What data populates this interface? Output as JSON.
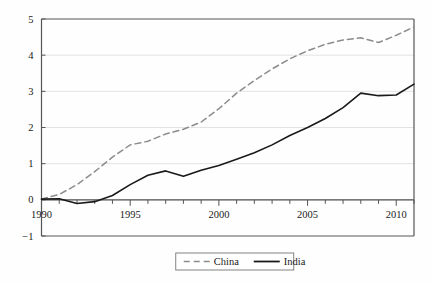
{
  "chart_data": {
    "type": "line",
    "title": "",
    "xlabel": "",
    "ylabel": "",
    "xlim": [
      1990,
      2011
    ],
    "ylim": [
      -1,
      5
    ],
    "grid": true,
    "legend_position": "bottom-center",
    "x": [
      1990,
      1991,
      1992,
      1993,
      1994,
      1995,
      1996,
      1997,
      1998,
      1999,
      2000,
      2001,
      2002,
      2003,
      2004,
      2005,
      2006,
      2007,
      2008,
      2009,
      2010,
      2011
    ],
    "y_ticks": [
      -1,
      0,
      1,
      2,
      3,
      4,
      5
    ],
    "y_tick_labels": [
      "−1",
      "0",
      "1",
      "2",
      "3",
      "4",
      "5"
    ],
    "x_ticks": [
      1990,
      1991,
      1992,
      1993,
      1994,
      1995,
      1996,
      1997,
      1998,
      1999,
      2000,
      2001,
      2002,
      2003,
      2004,
      2005,
      2006,
      2007,
      2008,
      2009,
      2010,
      2011
    ],
    "x_tick_labels_shown": [
      "1990",
      "1995",
      "2000",
      "2005",
      "2010"
    ],
    "x_tick_labels_values": [
      1990,
      1995,
      2000,
      2005,
      2010
    ],
    "series": [
      {
        "name": "China",
        "style": "dashed",
        "color": "#8c8c8c",
        "values": [
          0.02,
          0.15,
          0.42,
          0.78,
          1.18,
          1.52,
          1.62,
          1.82,
          1.95,
          2.15,
          2.52,
          2.95,
          3.3,
          3.62,
          3.9,
          4.12,
          4.3,
          4.42,
          4.48,
          4.35,
          4.55,
          4.78
        ]
      },
      {
        "name": "India",
        "style": "solid",
        "color": "#1a1a1a",
        "values": [
          0.02,
          0.03,
          -0.1,
          -0.05,
          0.12,
          0.42,
          0.68,
          0.8,
          0.65,
          0.82,
          0.95,
          1.12,
          1.3,
          1.52,
          1.78,
          2.0,
          2.25,
          2.55,
          2.95,
          2.88,
          2.9,
          3.2
        ]
      }
    ]
  },
  "legend": {
    "items": [
      {
        "label": "China",
        "style": "dashed",
        "color": "#8c8c8c"
      },
      {
        "label": "India",
        "style": "solid",
        "color": "#1a1a1a"
      }
    ]
  },
  "colors": {
    "china": "#8c8c8c",
    "india": "#1a1a1a",
    "axis": "#555555",
    "grid": "#dcdcdc",
    "background": "#fefefe"
  }
}
